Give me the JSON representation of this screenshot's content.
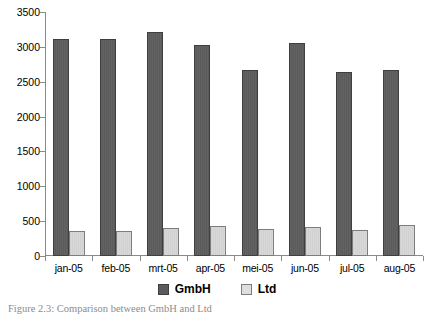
{
  "chart_data": {
    "type": "bar",
    "title": "",
    "subtitle": "",
    "xlabel": "",
    "ylabel": "",
    "categories": [
      "jan-05",
      "feb-05",
      "mrt-05",
      "apr-05",
      "mei-05",
      "jun-05",
      "jul-05",
      "aug-05"
    ],
    "series": [
      {
        "name": "GmbH",
        "color": "#5b5b5b",
        "values": [
          3120,
          3110,
          3220,
          3020,
          2670,
          3060,
          2640,
          2670
        ]
      },
      {
        "name": "Ltd",
        "color": "#d8d8d8",
        "values": [
          360,
          355,
          400,
          425,
          390,
          420,
          370,
          440
        ]
      }
    ],
    "ylim": [
      0,
      3500
    ],
    "ytick_values": [
      0,
      500,
      1000,
      1500,
      2000,
      2500,
      3000,
      3500
    ],
    "ytick_labels": [
      "0",
      "500",
      "1000",
      "1500",
      "2000",
      "2500",
      "3000",
      "3500"
    ],
    "grid": false,
    "legend_position": "bottom"
  },
  "legend": {
    "items": [
      {
        "label": "GmbH",
        "swatch": "legend-swatch-gmbh"
      },
      {
        "label": "Ltd",
        "swatch": "legend-swatch-ltd"
      }
    ]
  },
  "caption": {
    "text": "Figure 2.3: Comparison between GmbH and Ltd"
  },
  "colors": {
    "series_gmbh": "#5b5b5b",
    "series_ltd": "#d8d8d8",
    "axis": "#8a8a8a",
    "text": "#000000",
    "caption": "#8c8c8c"
  }
}
